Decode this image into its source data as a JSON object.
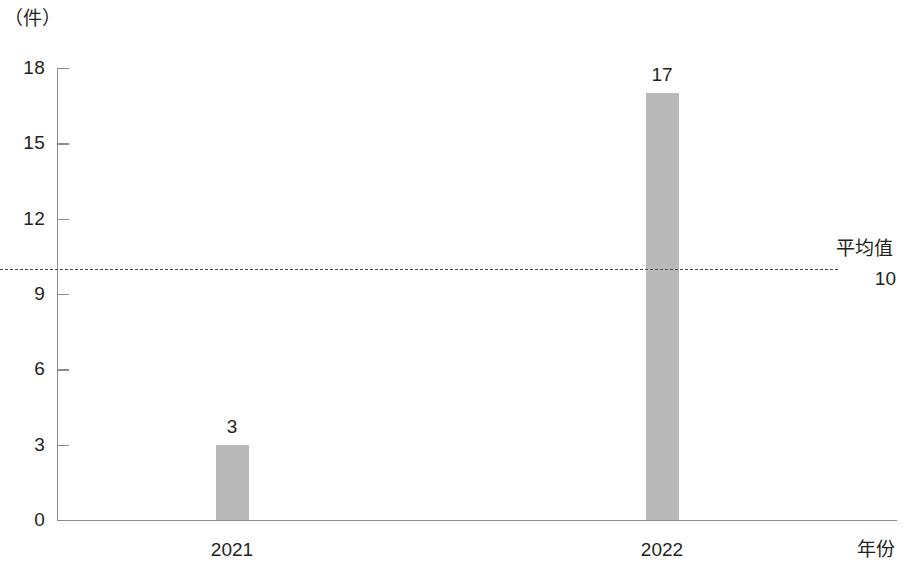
{
  "chart_data": {
    "type": "bar",
    "title": "",
    "subtitle": "",
    "xlabel": "年份",
    "ylabel": "（件）",
    "categories": [
      "2021",
      "2022"
    ],
    "values": [
      3,
      17
    ],
    "value_labels": [
      "3",
      "17"
    ],
    "series": [
      {
        "name": "件数",
        "values": [
          3,
          17
        ],
        "color": "#b9b9b9"
      }
    ],
    "ylim": [
      0,
      18
    ],
    "yticks": [
      0,
      3,
      6,
      9,
      12,
      15,
      18
    ],
    "ytick_labels": [
      "0",
      "3",
      "6",
      "9",
      "12",
      "15",
      "18"
    ],
    "grid": false,
    "legend": "none",
    "annotations": [
      {
        "name": "average-line",
        "label": "平均值",
        "value": 10,
        "value_label": "10",
        "style": "dashed",
        "color": "#4a4a4a"
      }
    ]
  },
  "axes": {
    "y_unit_label": "（件）",
    "x_title": "年份",
    "axis_color": "#8c8c8c"
  },
  "average": {
    "label": "平均值",
    "value_label": "10"
  },
  "colors": {
    "bar_fill": "#b9b9b9",
    "axis": "#8c8c8c",
    "text": "#231f20",
    "dashed_line": "#4a4a4a",
    "background": "#ffffff"
  }
}
